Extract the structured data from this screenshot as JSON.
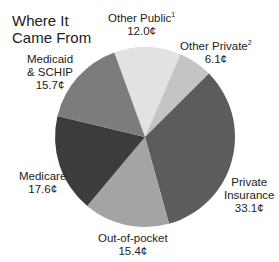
{
  "chart_data": {
    "type": "pie",
    "title": "Where It Came From",
    "unit": "¢",
    "start_angle_deg": -20,
    "center": [
      145,
      137
    ],
    "radius": 90,
    "slices": [
      {
        "label": "Other Public",
        "footnote": "1",
        "value": 12.0,
        "value_text": "12.0¢",
        "color": "#e2e2e2"
      },
      {
        "label": "Other Private",
        "footnote": "2",
        "value": 6.1,
        "value_text": "6.1¢",
        "color": "#c4c4c4"
      },
      {
        "label": "Private Insurance",
        "footnote": "",
        "value": 33.1,
        "value_text": "33.1¢",
        "color": "#5c5c5c"
      },
      {
        "label": "Out-of-pocket",
        "footnote": "",
        "value": 15.4,
        "value_text": "15.4¢",
        "color": "#a4a4a4"
      },
      {
        "label": "Medicare",
        "footnote": "",
        "value": 17.6,
        "value_text": "17.6¢",
        "color": "#3c3c3c"
      },
      {
        "label": "Medicaid & SCHIP",
        "footnote": "",
        "value": 15.7,
        "value_text": "15.7¢",
        "color": "#7c7c7c"
      }
    ]
  },
  "labels": {
    "title_line1": "Where It",
    "title_line2": "Came From",
    "other_public_name": "Other Public",
    "other_public_sup": "1",
    "other_public_value": "12.0¢",
    "other_private_name": "Other Private",
    "other_private_sup": "2",
    "other_private_value": "6.1¢",
    "private_insurance_line1": "Private",
    "private_insurance_line2": "Insurance",
    "private_insurance_value": "33.1¢",
    "out_of_pocket_name": "Out-of-pocket",
    "out_of_pocket_value": "15.4¢",
    "medicare_name": "Medicare",
    "medicare_value": "17.6¢",
    "medicaid_line1": "Medicaid",
    "medicaid_line2": "& SCHIP",
    "medicaid_value": "15.7¢"
  }
}
